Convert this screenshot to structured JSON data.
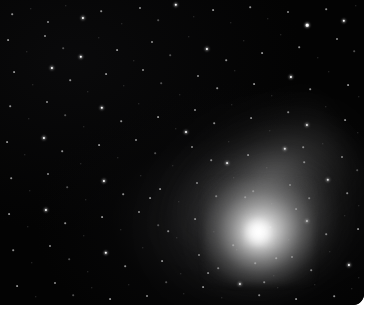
{
  "image": {
    "subject": "comet",
    "title": "Comet with bright coma and stellar field",
    "media": "astrophotograph",
    "background_color": "#000000",
    "page_color": "#ffffff",
    "plate": {
      "x": 0,
      "y": 0,
      "width": 364,
      "height": 305,
      "corner_radius": 11
    }
  },
  "comet": {
    "nucleus": {
      "x": 258,
      "y": 232,
      "peak_color": "#ffffff"
    },
    "coma": {
      "center_x": 258,
      "center_y": 232,
      "radius_x": 104,
      "radius_y": 88,
      "rotation_deg": -22,
      "color": "#dcdcdc"
    },
    "tail": {
      "direction": "upper-left",
      "angle_deg": -31,
      "length": 230,
      "color": "#9b9b9b"
    }
  },
  "stars": [
    {
      "x": 12,
      "y": 14,
      "r": 0.8,
      "c": "faint"
    },
    {
      "x": 31,
      "y": 9,
      "r": 0.7,
      "c": "dim"
    },
    {
      "x": 48,
      "y": 22,
      "r": 1.0,
      "c": "faint"
    },
    {
      "x": 66,
      "y": 6,
      "r": 0.7,
      "c": "dim"
    },
    {
      "x": 83,
      "y": 18,
      "r": 1.1,
      "c": "bright"
    },
    {
      "x": 101,
      "y": 11,
      "r": 0.8,
      "c": "faint"
    },
    {
      "x": 122,
      "y": 24,
      "r": 0.7,
      "c": "dim"
    },
    {
      "x": 140,
      "y": 8,
      "r": 1.0,
      "c": "faint"
    },
    {
      "x": 158,
      "y": 20,
      "r": 0.8,
      "c": "dim"
    },
    {
      "x": 176,
      "y": 5,
      "r": 1.2,
      "c": "bright"
    },
    {
      "x": 194,
      "y": 17,
      "r": 0.7,
      "c": "dim"
    },
    {
      "x": 213,
      "y": 10,
      "r": 0.9,
      "c": "faint"
    },
    {
      "x": 231,
      "y": 23,
      "r": 0.7,
      "c": "dim"
    },
    {
      "x": 250,
      "y": 7,
      "r": 0.8,
      "c": "faint"
    },
    {
      "x": 268,
      "y": 19,
      "r": 0.7,
      "c": "dim"
    },
    {
      "x": 288,
      "y": 12,
      "r": 1.0,
      "c": "faint"
    },
    {
      "x": 307,
      "y": 25,
      "r": 1.3,
      "c": "bright"
    },
    {
      "x": 326,
      "y": 9,
      "r": 0.8,
      "c": "faint"
    },
    {
      "x": 344,
      "y": 21,
      "r": 1.2,
      "c": "bright"
    },
    {
      "x": 356,
      "y": 6,
      "r": 0.7,
      "c": "dim"
    },
    {
      "x": 8,
      "y": 40,
      "r": 0.9,
      "c": "faint"
    },
    {
      "x": 27,
      "y": 52,
      "r": 0.7,
      "c": "dim"
    },
    {
      "x": 45,
      "y": 36,
      "r": 1.0,
      "c": "faint"
    },
    {
      "x": 63,
      "y": 48,
      "r": 0.8,
      "c": "dim"
    },
    {
      "x": 81,
      "y": 57,
      "r": 1.2,
      "c": "bright"
    },
    {
      "x": 99,
      "y": 38,
      "r": 0.7,
      "c": "dim"
    },
    {
      "x": 117,
      "y": 50,
      "r": 0.9,
      "c": "faint"
    },
    {
      "x": 134,
      "y": 61,
      "r": 0.7,
      "c": "dim"
    },
    {
      "x": 152,
      "y": 42,
      "r": 1.0,
      "c": "faint"
    },
    {
      "x": 170,
      "y": 55,
      "r": 0.8,
      "c": "dim"
    },
    {
      "x": 189,
      "y": 37,
      "r": 0.7,
      "c": "dim"
    },
    {
      "x": 207,
      "y": 49,
      "r": 1.1,
      "c": "bright"
    },
    {
      "x": 226,
      "y": 60,
      "r": 0.8,
      "c": "faint"
    },
    {
      "x": 244,
      "y": 41,
      "r": 0.7,
      "c": "dim"
    },
    {
      "x": 262,
      "y": 53,
      "r": 0.9,
      "c": "faint"
    },
    {
      "x": 281,
      "y": 35,
      "r": 0.7,
      "c": "dim"
    },
    {
      "x": 299,
      "y": 47,
      "r": 0.8,
      "c": "faint"
    },
    {
      "x": 318,
      "y": 58,
      "r": 0.7,
      "c": "dim"
    },
    {
      "x": 337,
      "y": 39,
      "r": 1.0,
      "c": "faint"
    },
    {
      "x": 354,
      "y": 51,
      "r": 0.8,
      "c": "dim"
    },
    {
      "x": 14,
      "y": 72,
      "r": 0.9,
      "c": "faint"
    },
    {
      "x": 33,
      "y": 85,
      "r": 0.7,
      "c": "dim"
    },
    {
      "x": 52,
      "y": 68,
      "r": 1.1,
      "c": "bright"
    },
    {
      "x": 70,
      "y": 80,
      "r": 0.8,
      "c": "faint"
    },
    {
      "x": 88,
      "y": 92,
      "r": 0.7,
      "c": "dim"
    },
    {
      "x": 106,
      "y": 74,
      "r": 0.9,
      "c": "faint"
    },
    {
      "x": 124,
      "y": 86,
      "r": 0.7,
      "c": "dim"
    },
    {
      "x": 143,
      "y": 70,
      "r": 1.0,
      "c": "faint"
    },
    {
      "x": 161,
      "y": 83,
      "r": 0.8,
      "c": "dim"
    },
    {
      "x": 180,
      "y": 95,
      "r": 0.7,
      "c": "dim"
    },
    {
      "x": 198,
      "y": 76,
      "r": 1.0,
      "c": "faint"
    },
    {
      "x": 217,
      "y": 88,
      "r": 0.8,
      "c": "faint"
    },
    {
      "x": 235,
      "y": 71,
      "r": 0.7,
      "c": "dim"
    },
    {
      "x": 254,
      "y": 84,
      "r": 0.9,
      "c": "faint"
    },
    {
      "x": 272,
      "y": 96,
      "r": 0.7,
      "c": "dim"
    },
    {
      "x": 291,
      "y": 77,
      "r": 1.1,
      "c": "bright"
    },
    {
      "x": 310,
      "y": 89,
      "r": 0.8,
      "c": "faint"
    },
    {
      "x": 329,
      "y": 72,
      "r": 0.7,
      "c": "dim"
    },
    {
      "x": 348,
      "y": 85,
      "r": 0.9,
      "c": "faint"
    },
    {
      "x": 359,
      "y": 97,
      "r": 0.7,
      "c": "dim"
    },
    {
      "x": 10,
      "y": 106,
      "r": 0.8,
      "c": "faint"
    },
    {
      "x": 29,
      "y": 119,
      "r": 0.7,
      "c": "dim"
    },
    {
      "x": 47,
      "y": 102,
      "r": 1.0,
      "c": "faint"
    },
    {
      "x": 65,
      "y": 115,
      "r": 0.8,
      "c": "dim"
    },
    {
      "x": 84,
      "y": 127,
      "r": 0.7,
      "c": "dim"
    },
    {
      "x": 102,
      "y": 108,
      "r": 1.2,
      "c": "bright"
    },
    {
      "x": 121,
      "y": 121,
      "r": 0.8,
      "c": "faint"
    },
    {
      "x": 139,
      "y": 104,
      "r": 0.7,
      "c": "dim"
    },
    {
      "x": 158,
      "y": 117,
      "r": 0.9,
      "c": "faint"
    },
    {
      "x": 176,
      "y": 129,
      "r": 0.7,
      "c": "dim"
    },
    {
      "x": 195,
      "y": 110,
      "r": 1.0,
      "c": "faint"
    },
    {
      "x": 214,
      "y": 123,
      "r": 0.8,
      "c": "faint"
    },
    {
      "x": 232,
      "y": 105,
      "r": 0.7,
      "c": "dim"
    },
    {
      "x": 251,
      "y": 118,
      "r": 0.9,
      "c": "faint"
    },
    {
      "x": 270,
      "y": 131,
      "r": 0.7,
      "c": "dim"
    },
    {
      "x": 288,
      "y": 112,
      "r": 0.8,
      "c": "faint"
    },
    {
      "x": 307,
      "y": 125,
      "r": 1.1,
      "c": "bright"
    },
    {
      "x": 326,
      "y": 107,
      "r": 0.7,
      "c": "dim"
    },
    {
      "x": 345,
      "y": 120,
      "r": 0.9,
      "c": "faint"
    },
    {
      "x": 358,
      "y": 133,
      "r": 0.7,
      "c": "dim"
    },
    {
      "x": 7,
      "y": 142,
      "r": 0.9,
      "c": "faint"
    },
    {
      "x": 25,
      "y": 155,
      "r": 0.7,
      "c": "dim"
    },
    {
      "x": 44,
      "y": 138,
      "r": 1.1,
      "c": "bright"
    },
    {
      "x": 62,
      "y": 151,
      "r": 0.8,
      "c": "faint"
    },
    {
      "x": 81,
      "y": 164,
      "r": 0.7,
      "c": "dim"
    },
    {
      "x": 99,
      "y": 145,
      "r": 0.9,
      "c": "faint"
    },
    {
      "x": 118,
      "y": 158,
      "r": 0.7,
      "c": "dim"
    },
    {
      "x": 136,
      "y": 140,
      "r": 1.0,
      "c": "faint"
    },
    {
      "x": 155,
      "y": 153,
      "r": 0.8,
      "c": "dim"
    },
    {
      "x": 173,
      "y": 166,
      "r": 0.7,
      "c": "dim"
    },
    {
      "x": 192,
      "y": 147,
      "r": 1.0,
      "c": "faint"
    },
    {
      "x": 211,
      "y": 160,
      "r": 0.8,
      "c": "faint"
    },
    {
      "x": 229,
      "y": 142,
      "r": 0.7,
      "c": "dim"
    },
    {
      "x": 248,
      "y": 155,
      "r": 0.9,
      "c": "faint"
    },
    {
      "x": 267,
      "y": 168,
      "r": 0.7,
      "c": "dim"
    },
    {
      "x": 285,
      "y": 149,
      "r": 1.2,
      "c": "bright"
    },
    {
      "x": 304,
      "y": 162,
      "r": 0.8,
      "c": "faint"
    },
    {
      "x": 323,
      "y": 144,
      "r": 0.7,
      "c": "dim"
    },
    {
      "x": 342,
      "y": 157,
      "r": 1.0,
      "c": "faint"
    },
    {
      "x": 357,
      "y": 170,
      "r": 0.8,
      "c": "dim"
    },
    {
      "x": 11,
      "y": 178,
      "r": 0.8,
      "c": "faint"
    },
    {
      "x": 30,
      "y": 191,
      "r": 0.7,
      "c": "dim"
    },
    {
      "x": 48,
      "y": 174,
      "r": 1.0,
      "c": "faint"
    },
    {
      "x": 67,
      "y": 187,
      "r": 0.8,
      "c": "dim"
    },
    {
      "x": 86,
      "y": 200,
      "r": 0.7,
      "c": "dim"
    },
    {
      "x": 104,
      "y": 181,
      "r": 1.1,
      "c": "bright"
    },
    {
      "x": 123,
      "y": 194,
      "r": 0.8,
      "c": "faint"
    },
    {
      "x": 141,
      "y": 176,
      "r": 0.7,
      "c": "dim"
    },
    {
      "x": 160,
      "y": 189,
      "r": 0.9,
      "c": "faint"
    },
    {
      "x": 179,
      "y": 202,
      "r": 0.7,
      "c": "dim"
    },
    {
      "x": 197,
      "y": 183,
      "r": 1.0,
      "c": "faint"
    },
    {
      "x": 216,
      "y": 196,
      "r": 0.8,
      "c": "faint"
    },
    {
      "x": 234,
      "y": 178,
      "r": 0.7,
      "c": "dim"
    },
    {
      "x": 253,
      "y": 191,
      "r": 0.8,
      "c": "faint"
    },
    {
      "x": 272,
      "y": 204,
      "r": 0.7,
      "c": "dim"
    },
    {
      "x": 290,
      "y": 185,
      "r": 1.0,
      "c": "faint"
    },
    {
      "x": 309,
      "y": 198,
      "r": 0.8,
      "c": "faint"
    },
    {
      "x": 328,
      "y": 180,
      "r": 1.2,
      "c": "bright"
    },
    {
      "x": 347,
      "y": 193,
      "r": 0.8,
      "c": "faint"
    },
    {
      "x": 359,
      "y": 206,
      "r": 0.7,
      "c": "dim"
    },
    {
      "x": 9,
      "y": 214,
      "r": 0.9,
      "c": "faint"
    },
    {
      "x": 28,
      "y": 227,
      "r": 0.7,
      "c": "dim"
    },
    {
      "x": 46,
      "y": 210,
      "r": 1.1,
      "c": "bright"
    },
    {
      "x": 65,
      "y": 223,
      "r": 0.8,
      "c": "faint"
    },
    {
      "x": 84,
      "y": 236,
      "r": 0.7,
      "c": "dim"
    },
    {
      "x": 102,
      "y": 217,
      "r": 0.9,
      "c": "faint"
    },
    {
      "x": 121,
      "y": 230,
      "r": 0.7,
      "c": "dim"
    },
    {
      "x": 139,
      "y": 212,
      "r": 1.0,
      "c": "faint"
    },
    {
      "x": 158,
      "y": 225,
      "r": 0.8,
      "c": "dim"
    },
    {
      "x": 177,
      "y": 238,
      "r": 0.7,
      "c": "dim"
    },
    {
      "x": 195,
      "y": 219,
      "r": 0.9,
      "c": "faint"
    },
    {
      "x": 214,
      "y": 232,
      "r": 0.7,
      "c": "dim"
    },
    {
      "x": 233,
      "y": 245,
      "r": 0.8,
      "c": "faint"
    },
    {
      "x": 251,
      "y": 214,
      "r": 0.7,
      "c": "dim"
    },
    {
      "x": 270,
      "y": 227,
      "r": 0.8,
      "c": "faint"
    },
    {
      "x": 289,
      "y": 240,
      "r": 0.7,
      "c": "dim"
    },
    {
      "x": 307,
      "y": 221,
      "r": 1.1,
      "c": "bright"
    },
    {
      "x": 326,
      "y": 234,
      "r": 0.8,
      "c": "faint"
    },
    {
      "x": 345,
      "y": 216,
      "r": 0.7,
      "c": "dim"
    },
    {
      "x": 358,
      "y": 229,
      "r": 0.9,
      "c": "faint"
    },
    {
      "x": 13,
      "y": 250,
      "r": 0.8,
      "c": "faint"
    },
    {
      "x": 32,
      "y": 263,
      "r": 0.7,
      "c": "dim"
    },
    {
      "x": 50,
      "y": 246,
      "r": 1.0,
      "c": "faint"
    },
    {
      "x": 69,
      "y": 259,
      "r": 0.8,
      "c": "dim"
    },
    {
      "x": 88,
      "y": 272,
      "r": 0.7,
      "c": "dim"
    },
    {
      "x": 106,
      "y": 253,
      "r": 1.2,
      "c": "bright"
    },
    {
      "x": 125,
      "y": 266,
      "r": 0.8,
      "c": "faint"
    },
    {
      "x": 143,
      "y": 248,
      "r": 0.7,
      "c": "dim"
    },
    {
      "x": 162,
      "y": 261,
      "r": 0.9,
      "c": "faint"
    },
    {
      "x": 181,
      "y": 274,
      "r": 0.7,
      "c": "dim"
    },
    {
      "x": 199,
      "y": 255,
      "r": 1.0,
      "c": "faint"
    },
    {
      "x": 218,
      "y": 268,
      "r": 0.8,
      "c": "faint"
    },
    {
      "x": 237,
      "y": 250,
      "r": 0.7,
      "c": "dim"
    },
    {
      "x": 255,
      "y": 263,
      "r": 0.8,
      "c": "faint"
    },
    {
      "x": 274,
      "y": 276,
      "r": 0.7,
      "c": "dim"
    },
    {
      "x": 292,
      "y": 257,
      "r": 1.0,
      "c": "faint"
    },
    {
      "x": 311,
      "y": 270,
      "r": 0.8,
      "c": "faint"
    },
    {
      "x": 330,
      "y": 252,
      "r": 0.7,
      "c": "dim"
    },
    {
      "x": 349,
      "y": 265,
      "r": 1.1,
      "c": "bright"
    },
    {
      "x": 359,
      "y": 278,
      "r": 0.7,
      "c": "dim"
    },
    {
      "x": 17,
      "y": 286,
      "r": 0.9,
      "c": "faint"
    },
    {
      "x": 36,
      "y": 297,
      "r": 0.7,
      "c": "dim"
    },
    {
      "x": 55,
      "y": 283,
      "r": 1.0,
      "c": "faint"
    },
    {
      "x": 73,
      "y": 295,
      "r": 0.8,
      "c": "dim"
    },
    {
      "x": 92,
      "y": 288,
      "r": 0.7,
      "c": "dim"
    },
    {
      "x": 110,
      "y": 299,
      "r": 0.9,
      "c": "faint"
    },
    {
      "x": 129,
      "y": 285,
      "r": 0.7,
      "c": "dim"
    },
    {
      "x": 147,
      "y": 296,
      "r": 1.0,
      "c": "faint"
    },
    {
      "x": 166,
      "y": 282,
      "r": 0.8,
      "c": "dim"
    },
    {
      "x": 184,
      "y": 294,
      "r": 0.7,
      "c": "dim"
    },
    {
      "x": 203,
      "y": 287,
      "r": 0.9,
      "c": "faint"
    },
    {
      "x": 222,
      "y": 298,
      "r": 0.7,
      "c": "dim"
    },
    {
      "x": 240,
      "y": 284,
      "r": 1.1,
      "c": "bright"
    },
    {
      "x": 259,
      "y": 295,
      "r": 0.8,
      "c": "faint"
    },
    {
      "x": 278,
      "y": 288,
      "r": 0.7,
      "c": "dim"
    },
    {
      "x": 296,
      "y": 299,
      "r": 0.9,
      "c": "faint"
    },
    {
      "x": 315,
      "y": 285,
      "r": 0.7,
      "c": "dim"
    },
    {
      "x": 334,
      "y": 296,
      "r": 0.8,
      "c": "faint"
    },
    {
      "x": 352,
      "y": 289,
      "r": 0.7,
      "c": "dim"
    },
    {
      "x": 186,
      "y": 132,
      "r": 1.0,
      "c": "bright"
    },
    {
      "x": 227,
      "y": 163,
      "r": 0.9,
      "c": "bright"
    },
    {
      "x": 245,
      "y": 197,
      "r": 0.8,
      "c": "faint"
    },
    {
      "x": 296,
      "y": 209,
      "r": 0.9,
      "c": "faint"
    },
    {
      "x": 276,
      "y": 258,
      "r": 0.8,
      "c": "faint"
    },
    {
      "x": 208,
      "y": 273,
      "r": 0.9,
      "c": "faint"
    },
    {
      "x": 168,
      "y": 231,
      "r": 0.8,
      "c": "faint"
    },
    {
      "x": 303,
      "y": 147,
      "r": 0.8,
      "c": "faint"
    },
    {
      "x": 150,
      "y": 198,
      "r": 0.9,
      "c": "faint"
    },
    {
      "x": 264,
      "y": 282,
      "r": 0.8,
      "c": "faint"
    }
  ]
}
